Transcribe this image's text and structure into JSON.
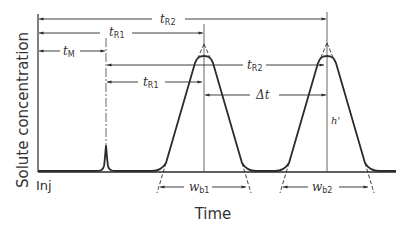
{
  "diagram": {
    "type": "chromatogram",
    "colors": {
      "ink": "#2b2b2b",
      "light_ink": "#555555",
      "background": "#ffffff"
    },
    "axes": {
      "ylabel": "Solute concentration",
      "xlabel": "Time",
      "origin_label": "Inj"
    },
    "labels": {
      "tM": {
        "main": "t",
        "sub": "M"
      },
      "tR1_top": {
        "main": "t",
        "sub": "R1"
      },
      "tR2_top": {
        "main": "t",
        "sub": "R2"
      },
      "tR1_inner": {
        "main": "t",
        "sub": "R1"
      },
      "tR2_inner": {
        "main": "t",
        "sub": "R2"
      },
      "delta_t": {
        "main": "Δt"
      },
      "h_prime": {
        "main": "h'"
      },
      "wb1": {
        "main": "w",
        "sub": "b1"
      },
      "wb2": {
        "main": "w",
        "sub": "b2"
      }
    },
    "features": {
      "unretained_peak": "small spike at dead time t_M",
      "peak1": "Gaussian-like peak with tangent lines forming triangle; base width w_b1",
      "peak2": "Gaussian-like peak with tangent lines forming triangle; base width w_b2, height h'"
    }
  }
}
